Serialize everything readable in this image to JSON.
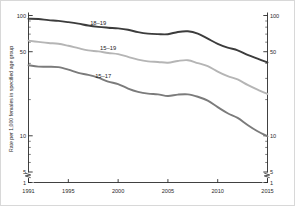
{
  "chart_data": {
    "type": "line",
    "title": "",
    "subtitle": "",
    "xlabel": "",
    "ylabel": "Rate per 1,000 females in specified age group",
    "yscale": "log",
    "ylim": [
      1,
      100
    ],
    "xlim": [
      1991,
      2015
    ],
    "grid": false,
    "legend_position": "inline-annotations",
    "axis_break": {
      "y_between": [
        1,
        5
      ],
      "x_at_ends": true,
      "note": "zigzag break on both vertical axes between 1 and 5, and short breaks at each end of the x axis"
    },
    "y_ticks_major": [
      1,
      5,
      10,
      50,
      100
    ],
    "y_tick_labels": [
      "1",
      "5",
      "10",
      "50",
      "100"
    ],
    "y_ticks_minor": [
      2,
      3,
      4,
      6,
      7,
      8,
      9,
      20,
      30,
      40,
      60,
      70,
      80,
      90
    ],
    "x_ticks": [
      1991,
      1995,
      2000,
      2005,
      2010,
      2015
    ],
    "x_tick_labels": [
      "1991",
      "1995",
      "2000",
      "2005",
      "2010",
      "2015"
    ],
    "x": [
      1991,
      1992,
      1993,
      1994,
      1995,
      1996,
      1997,
      1998,
      1999,
      2000,
      2001,
      2002,
      2003,
      2004,
      2005,
      2006,
      2007,
      2008,
      2009,
      2010,
      2011,
      2012,
      2013,
      2014,
      2015
    ],
    "series": [
      {
        "name": "18-19",
        "label": "18–19",
        "color": "#3c3c3c",
        "values": [
          94.0,
          93.5,
          91.5,
          90.2,
          88.0,
          85.5,
          82.5,
          80.5,
          79.2,
          78.1,
          76.1,
          72.8,
          70.7,
          70.0,
          69.9,
          73.0,
          73.9,
          70.7,
          64.2,
          58.2,
          54.1,
          51.4,
          47.1,
          43.8,
          40.7
        ]
      },
      {
        "name": "15-19",
        "label": "15–19",
        "color": "#b5b5b5",
        "values": [
          61.8,
          60.3,
          59.0,
          58.2,
          56.0,
          53.5,
          51.3,
          50.3,
          48.8,
          47.7,
          45.3,
          43.0,
          41.6,
          41.1,
          40.5,
          41.9,
          42.5,
          40.2,
          37.9,
          34.2,
          31.3,
          29.4,
          26.5,
          24.2,
          22.3
        ]
      },
      {
        "name": "15-17",
        "label": "15–17",
        "color": "#7b7b7b",
        "values": [
          38.6,
          37.6,
          37.5,
          37.2,
          35.5,
          33.3,
          32.1,
          30.4,
          28.2,
          26.9,
          24.7,
          23.2,
          22.4,
          22.1,
          21.4,
          22.0,
          22.1,
          21.1,
          19.6,
          17.3,
          15.4,
          14.1,
          12.3,
          10.9,
          9.9
        ]
      }
    ],
    "annotations": [
      {
        "text": "18–19",
        "x": 1998.0,
        "y": 84.0
      },
      {
        "text": "15–19",
        "x": 1999.0,
        "y": 52.0
      },
      {
        "text": "15–17",
        "x": 1998.5,
        "y": 30.5
      }
    ]
  }
}
